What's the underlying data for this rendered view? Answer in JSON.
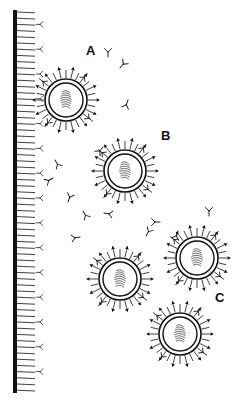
{
  "diagram": {
    "title": "",
    "colors": {
      "ink": "#111111",
      "background": "#ffffff"
    },
    "membrane": {
      "label": "",
      "x": 15,
      "top": 10,
      "bottom": 393,
      "tick_length": 18,
      "tick_spacing": 6.2
    },
    "labels": [
      {
        "id": "A",
        "text": "A",
        "x": 86,
        "y": 51
      },
      {
        "id": "B",
        "text": "B",
        "x": 162,
        "y": 136
      },
      {
        "id": "C",
        "text": "C",
        "x": 216,
        "y": 298
      }
    ],
    "particles": [
      {
        "group": "A",
        "cx": 66,
        "cy": 100
      },
      {
        "group": "B",
        "cx": 125,
        "cy": 171
      },
      {
        "group": "C",
        "cx": 120,
        "cy": 279
      },
      {
        "group": "C",
        "cx": 197,
        "cy": 258
      },
      {
        "group": "C",
        "cx": 180,
        "cy": 334
      }
    ],
    "free_antibodies": [
      {
        "x": 108,
        "y": 57,
        "r": 0
      },
      {
        "x": 120,
        "y": 68,
        "r": 40
      },
      {
        "x": 128,
        "y": 100,
        "r": 200
      },
      {
        "x": 55,
        "y": 160,
        "r": 150
      },
      {
        "x": 53,
        "y": 178,
        "r": 240
      },
      {
        "x": 68,
        "y": 202,
        "r": 20
      },
      {
        "x": 83,
        "y": 211,
        "r": 150
      },
      {
        "x": 80,
        "y": 237,
        "r": 260
      },
      {
        "x": 104,
        "y": 213,
        "r": 100
      },
      {
        "x": 160,
        "y": 222,
        "r": 270
      },
      {
        "x": 146,
        "y": 236,
        "r": 30
      },
      {
        "x": 209,
        "y": 216,
        "r": 0
      },
      {
        "x": 178,
        "y": 231,
        "r": 200
      },
      {
        "x": 103,
        "y": 147,
        "r": 220
      }
    ]
  }
}
